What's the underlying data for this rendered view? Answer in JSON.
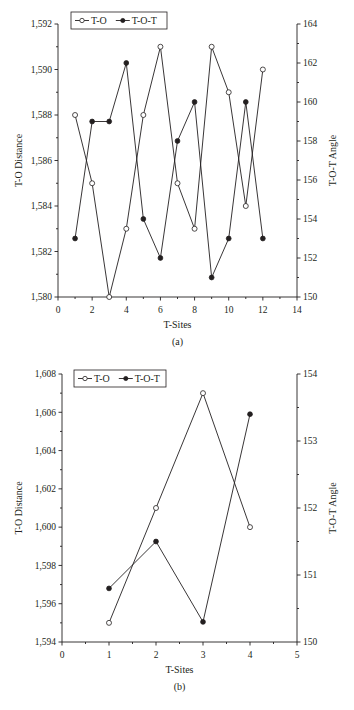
{
  "chart_data": [
    {
      "id": "a",
      "type": "line",
      "caption": "(a)",
      "title": "",
      "xlabel": "T-Sites",
      "ylabel": "T-O Distance",
      "y2label": "T-O-T Angle",
      "xlim": [
        0,
        14
      ],
      "xticks": [
        0,
        2,
        4,
        6,
        8,
        10,
        12,
        14
      ],
      "xtick_labels": [
        "0",
        "2",
        "4",
        "6",
        "8",
        "10",
        "12",
        "14"
      ],
      "ylim": [
        1.58,
        1.592
      ],
      "yticks": [
        1.58,
        1.582,
        1.584,
        1.586,
        1.588,
        1.59,
        1.592
      ],
      "ytick_labels": [
        "1,580",
        "1,582",
        "1,584",
        "1,586",
        "1,588",
        "1,590",
        "1,592"
      ],
      "y2lim": [
        150,
        164
      ],
      "y2ticks": [
        150,
        152,
        154,
        156,
        158,
        160,
        162,
        164
      ],
      "y2tick_labels": [
        "150",
        "152",
        "154",
        "156",
        "158",
        "160",
        "162",
        "164"
      ],
      "grid": false,
      "legend_position": "top-inside",
      "x": [
        1,
        2,
        3,
        4,
        5,
        6,
        7,
        8,
        9,
        10,
        11,
        12
      ],
      "series": [
        {
          "name": "T-O",
          "axis": "left",
          "marker": "open-circle",
          "values": [
            1.588,
            1.585,
            1.58,
            1.583,
            1.588,
            1.591,
            1.585,
            1.583,
            1.591,
            1.589,
            1.584,
            1.59
          ]
        },
        {
          "name": "T-O-T",
          "axis": "right",
          "marker": "filled-circle",
          "values": [
            153,
            159,
            159,
            162,
            154,
            152,
            158,
            160,
            151,
            153,
            160,
            153
          ]
        }
      ]
    },
    {
      "id": "b",
      "type": "line",
      "caption": "(b)",
      "title": "",
      "xlabel": "T-Sites",
      "ylabel": "T-O Distance",
      "y2label": "T-O-T Angle",
      "xlim": [
        0,
        5
      ],
      "xticks": [
        0,
        1,
        2,
        3,
        4,
        5
      ],
      "xtick_labels": [
        "0",
        "1",
        "2",
        "3",
        "4",
        "5"
      ],
      "ylim": [
        1.594,
        1.608
      ],
      "yticks": [
        1.594,
        1.596,
        1.598,
        1.6,
        1.602,
        1.604,
        1.606,
        1.608
      ],
      "ytick_labels": [
        "1,594",
        "1,596",
        "1,598",
        "1,600",
        "1,602",
        "1,604",
        "1,606",
        "1,608"
      ],
      "y2lim": [
        150,
        154
      ],
      "y2ticks": [
        150,
        151,
        152,
        153,
        154
      ],
      "y2tick_labels": [
        "150",
        "151",
        "152",
        "153",
        "154"
      ],
      "grid": false,
      "legend_position": "top-inside",
      "x": [
        1,
        2,
        3,
        4
      ],
      "series": [
        {
          "name": "T-O",
          "axis": "left",
          "marker": "open-circle",
          "values": [
            1.595,
            1.601,
            1.607,
            1.6
          ]
        },
        {
          "name": "T-O-T",
          "axis": "right",
          "marker": "filled-circle",
          "values": [
            150.8,
            151.5,
            150.3,
            153.4
          ]
        }
      ]
    }
  ],
  "colors": {
    "line": "#231f20",
    "background": "#ffffff"
  }
}
